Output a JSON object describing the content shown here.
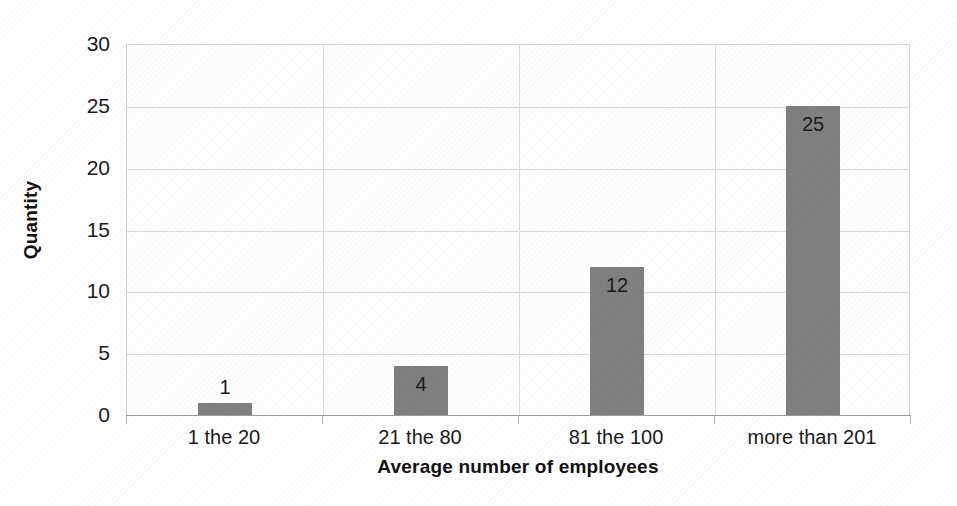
{
  "chart_data": {
    "type": "bar",
    "title": "",
    "xlabel": "Average number of employees",
    "ylabel": "Quantity",
    "categories": [
      "1 the 20",
      "21 the 80",
      "81 the 100",
      "more than 201"
    ],
    "values": [
      1,
      4,
      12,
      25
    ],
    "value_labels": [
      "1",
      "4",
      "12",
      "25"
    ],
    "ylim": [
      0,
      30
    ],
    "yticks": [
      0,
      5,
      10,
      15,
      20,
      25,
      30
    ],
    "ytick_labels": [
      "0",
      "5",
      "10",
      "15",
      "20",
      "25",
      "30"
    ],
    "grid": true,
    "legend": false,
    "bar_color": "#808080",
    "gridline_color": "#d9d9d9",
    "axis_color": "#9a9a9a",
    "plot_background": "#fefefe"
  }
}
